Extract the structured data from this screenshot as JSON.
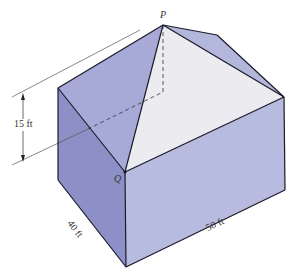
{
  "figure": {
    "type": "house-roof-geometry",
    "labels": {
      "apex": "P",
      "corner": "Q",
      "height": "15 ft",
      "width": "40 ft",
      "length": "50 ft"
    },
    "colors": {
      "left_face": "#8c90c6",
      "right_face": "#b8bbe0",
      "roof_left": "#a7aad6",
      "roof_right": "#b4b7dc",
      "roof_front": "#ebebf0",
      "edge": "#1a1a2a",
      "dimension_line": "#555555"
    },
    "dimensions": {
      "height_ft": 15,
      "width_ft": 40,
      "length_ft": 50
    }
  }
}
